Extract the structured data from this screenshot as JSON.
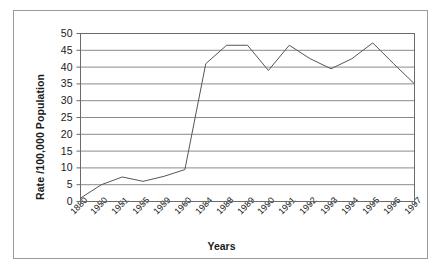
{
  "chart_data": {
    "type": "line",
    "title": "",
    "xlabel": "Years",
    "ylabel": "Rate /100,000 Population",
    "categories": [
      "1880",
      "1950",
      "1951",
      "1955",
      "1959",
      "1960",
      "1984",
      "1988",
      "1989",
      "1990",
      "1991",
      "1992",
      "1993",
      "1994",
      "1995",
      "1996",
      "1997"
    ],
    "values": [
      1,
      5,
      7.3,
      6,
      7.5,
      9.5,
      41,
      46.5,
      46.5,
      39,
      46.5,
      42.5,
      39.5,
      42.5,
      47.2,
      41,
      35
    ],
    "series": [
      {
        "name": "Rate",
        "values": [
          1,
          5,
          7.3,
          6,
          7.5,
          9.5,
          41,
          46.5,
          46.5,
          39,
          46.5,
          42.5,
          39.5,
          42.5,
          47.2,
          41,
          35
        ]
      }
    ],
    "ylim": [
      0,
      50
    ],
    "ytick_labels": [
      "50",
      "45",
      "40",
      "35",
      "30",
      "25",
      "20",
      "15",
      "10",
      "5",
      "0"
    ],
    "ytick_values": [
      50,
      45,
      40,
      35,
      30,
      25,
      20,
      15,
      10,
      5,
      0
    ],
    "grid": true,
    "grid_axis": "y",
    "legend": "none",
    "line_color": "#555555",
    "grid_color": "#8a8a8a",
    "axis_color": "#6a6a6a",
    "background_color": "#ffffff",
    "text_color": "#1a1a1a"
  },
  "axis": {
    "x_title": "Years",
    "y_title": "Rate /100,000 Population"
  }
}
